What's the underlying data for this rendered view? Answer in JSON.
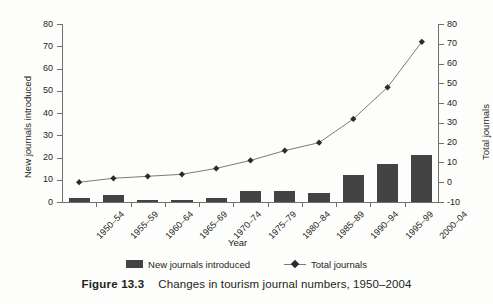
{
  "figure": {
    "caption_number": "Figure 13.3",
    "caption_text": "Changes in tourism journal numbers, 1950–2004"
  },
  "legend": {
    "bar_label": "New journals introduced",
    "line_label": "Total journals",
    "bar_swatch_icon": "filled-square-icon",
    "line_swatch_icon": "line-diamond-marker-icon"
  },
  "colors": {
    "bar_fill": "#434343",
    "line_stroke": "#7a7a7a",
    "marker_fill": "#2b2b2b",
    "axis": "#6f6f6f",
    "text": "#231f20",
    "background": "#fdfdfb"
  },
  "chart_data": {
    "type": "bar",
    "title": "Changes in tourism journal numbers, 1950–2004",
    "xlabel": "Year",
    "grid": false,
    "legend_position": "bottom-center",
    "categories": [
      "1950–54",
      "1955–59",
      "1960–64",
      "1965–69",
      "1970–74",
      "1975–79",
      "1980–84",
      "1985–89",
      "1990–94",
      "1995–99",
      "2000–04"
    ],
    "axes": {
      "left": {
        "label": "New journals introduced",
        "min": 0,
        "max": 80,
        "step": 10,
        "ticks": [
          0,
          10,
          20,
          30,
          40,
          50,
          60,
          70,
          80
        ]
      },
      "right": {
        "label": "Total journals",
        "min": -10,
        "max": 80,
        "step": 10,
        "ticks": [
          -10,
          0,
          10,
          20,
          30,
          40,
          50,
          60,
          70,
          80
        ]
      }
    },
    "series": [
      {
        "name": "New journals introduced",
        "render": "bar",
        "axis": "left",
        "values": [
          2,
          3,
          1,
          1,
          2,
          5,
          5,
          4,
          12,
          17,
          21
        ]
      },
      {
        "name": "Total journals",
        "render": "line",
        "axis": "right",
        "marker": "diamond",
        "values": [
          0,
          2,
          3,
          4,
          7,
          11,
          16,
          20,
          32,
          48,
          71
        ]
      }
    ]
  }
}
